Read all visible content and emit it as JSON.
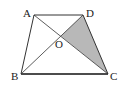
{
  "figure": {
    "type": "trapezoid-with-diagonals",
    "shaded_region": "triangle OCD",
    "shade_color": "#b8b8b8",
    "stroke_color": "#333333",
    "points": {
      "A": {
        "label": "A",
        "x": 34,
        "y": 15
      },
      "D": {
        "label": "D",
        "x": 83,
        "y": 15
      },
      "B": {
        "label": "B",
        "x": 21,
        "y": 74
      },
      "C": {
        "label": "C",
        "x": 108,
        "y": 74
      },
      "O": {
        "label": "O",
        "x": 61,
        "y": 36
      }
    }
  }
}
